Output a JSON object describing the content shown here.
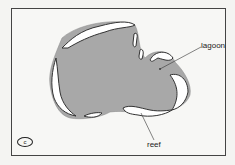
{
  "figure": {
    "panel_label": "c",
    "labels": {
      "lagoon": "lagoon",
      "reef": "reef"
    },
    "colors": {
      "lagoon_fill": "#a8a8a8",
      "reef_fill": "#ffffff",
      "outline": "#333333",
      "background": "#f7f7f5"
    }
  }
}
